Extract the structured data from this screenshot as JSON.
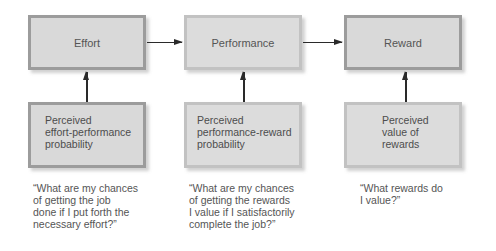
{
  "diagram": {
    "type": "expectancy-theory-model",
    "top_row": [
      {
        "label": "Effort"
      },
      {
        "label": "Performance"
      },
      {
        "label": "Reward"
      }
    ],
    "bottom_row": [
      {
        "lines": [
          "Perceived",
          "effort-performance",
          "probability"
        ]
      },
      {
        "lines": [
          "Perceived",
          "performance-reward",
          "probability"
        ]
      },
      {
        "lines": [
          "Perceived",
          "value of",
          "rewards"
        ]
      }
    ],
    "quotes": [
      {
        "lines": [
          "“What are my chances",
          "of getting the job",
          "done if I put forth the",
          "necessary effort?”"
        ]
      },
      {
        "lines": [
          "“What are my chances",
          "of getting the rewards",
          "I value if I satisfactorily",
          "complete the job?”"
        ]
      },
      {
        "lines": [
          "“What rewards do",
          "I value?”"
        ]
      }
    ],
    "edges": [
      {
        "from": "Effort",
        "to": "Performance"
      },
      {
        "from": "Performance",
        "to": "Reward"
      },
      {
        "from": "Perceived effort-performance probability",
        "to": "Effort"
      },
      {
        "from": "Perceived performance-reward probability",
        "to": "Performance"
      },
      {
        "from": "Perceived value of rewards",
        "to": "Reward"
      }
    ],
    "colors": {
      "box_fill": "#d9d9d9",
      "border_dark": "#9c9c9c",
      "border_light": "#c2c2c2",
      "arrow": "#2a2a2a",
      "text": "#4d4d4d"
    }
  }
}
